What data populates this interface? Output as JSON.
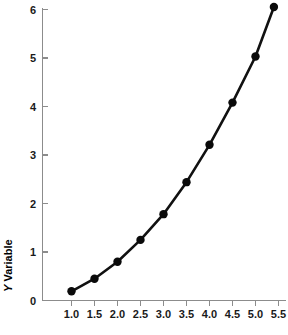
{
  "chart_data": {
    "type": "line",
    "title": "",
    "subtitle": "",
    "xlabel": "",
    "ylabel": "Y Variable",
    "ylabel_parts": {
      "italic": "Y",
      "roman": " Variable"
    },
    "x": [
      1.0,
      1.5,
      2.0,
      2.5,
      3.0,
      3.5,
      4.0,
      4.5,
      5.0,
      5.4
    ],
    "values": [
      0.19,
      0.45,
      0.8,
      1.25,
      1.78,
      2.44,
      3.21,
      4.08,
      5.03,
      6.05
    ],
    "series": [
      {
        "name": "Y Variable",
        "x": [
          1.0,
          1.5,
          2.0,
          2.5,
          3.0,
          3.5,
          4.0,
          4.5,
          5.0,
          5.4
        ],
        "values": [
          0.19,
          0.45,
          0.8,
          1.25,
          1.78,
          2.44,
          3.21,
          4.08,
          5.03,
          6.05
        ],
        "marker": "filled-circle",
        "marker_color": "#0a0a0a",
        "line_color": "#111111"
      }
    ],
    "xticks": [
      1.0,
      1.5,
      2.0,
      2.5,
      3.0,
      3.5,
      4.0,
      4.5,
      5.0,
      5.5
    ],
    "xticklabels": [
      "1.0",
      "1.5",
      "2.0",
      "2.5",
      "3.0",
      "3.5",
      "4.0",
      "4.5",
      "5.0",
      "5.5"
    ],
    "yticks": [
      0,
      1,
      2,
      3,
      4,
      5,
      6
    ],
    "yticklabels": [
      "0",
      "1",
      "2",
      "3",
      "4",
      "5",
      "6"
    ],
    "xlim": [
      0.72,
      5.68
    ],
    "ylim": [
      0,
      6.2
    ],
    "grid": false,
    "legend": null,
    "legend_position": "none",
    "background_color": "#ffffff",
    "axis_color": "#8c8c8c",
    "annotations": []
  },
  "axes": {
    "y_title": "Y Variable",
    "y_title_italic": "Y",
    "y_title_roman": " Variable"
  },
  "ticks": {
    "y": [
      "6",
      "5",
      "4",
      "3",
      "2",
      "1",
      "0"
    ],
    "x": [
      "1.0",
      "1.5",
      "2.0",
      "2.5",
      "3.0",
      "3.5",
      "4.0",
      "4.5",
      "5.0",
      "5.5"
    ]
  }
}
